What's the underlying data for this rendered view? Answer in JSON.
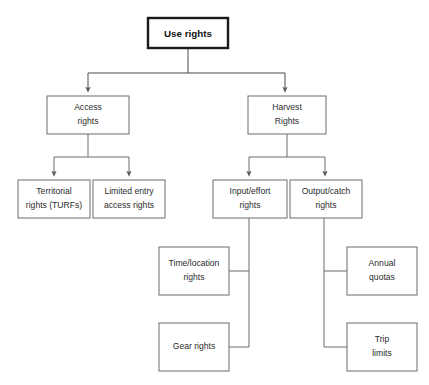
{
  "diagram": {
    "type": "hierarchy-flowchart",
    "theme": {
      "background": "#ffffff",
      "box_stroke": "#6c6c6c",
      "root_box_stroke": "#1a1a1a",
      "edge_stroke": "#6c6c6c",
      "text_color": "#2b2b2b"
    },
    "nodes": {
      "root": {
        "id": "use-rights",
        "lines": [
          "Use rights"
        ],
        "x": 148,
        "y": 18,
        "w": 80,
        "h": 30,
        "emphasis": "bold"
      },
      "level2": [
        {
          "id": "access-rights",
          "lines": [
            "Access",
            "rights"
          ],
          "x": 47,
          "y": 96,
          "w": 82,
          "h": 38
        },
        {
          "id": "harvest-rights",
          "lines": [
            "Harvest",
            "Rights"
          ],
          "x": 248,
          "y": 96,
          "w": 78,
          "h": 38
        }
      ],
      "level3": [
        {
          "id": "territorial-rights-turfs",
          "lines": [
            "Territorial",
            "rights (TURFs)"
          ],
          "x": 18,
          "y": 180,
          "w": 72,
          "h": 38
        },
        {
          "id": "limited-entry-access-rights",
          "lines": [
            "Limited entry",
            "access rights"
          ],
          "x": 93,
          "y": 180,
          "w": 72,
          "h": 38
        },
        {
          "id": "input-effort-rights",
          "lines": [
            "Input/effort",
            "rights"
          ],
          "x": 213,
          "y": 180,
          "w": 74,
          "h": 38
        },
        {
          "id": "output-catch-rights",
          "lines": [
            "Output/catch",
            "rights"
          ],
          "x": 290,
          "y": 180,
          "w": 72,
          "h": 38
        }
      ],
      "level4": [
        {
          "id": "time-location-rights",
          "lines": [
            "Time/location",
            "rights"
          ],
          "x": 159,
          "y": 247,
          "w": 70,
          "h": 48,
          "parent": "input-effort-rights",
          "side": "left"
        },
        {
          "id": "gear-rights",
          "lines": [
            "Gear rights"
          ],
          "x": 159,
          "y": 323,
          "w": 70,
          "h": 48,
          "parent": "input-effort-rights",
          "side": "left"
        },
        {
          "id": "annual-quotas",
          "lines": [
            "Annual",
            "quotas"
          ],
          "x": 347,
          "y": 247,
          "w": 70,
          "h": 48,
          "parent": "output-catch-rights",
          "side": "right"
        },
        {
          "id": "trip-limits",
          "lines": [
            "Trip",
            "limits"
          ],
          "x": 347,
          "y": 323,
          "w": 70,
          "h": 48,
          "parent": "output-catch-rights",
          "side": "right"
        }
      ]
    },
    "labels": {
      "root_0": "Use rights",
      "access_0": "Access",
      "access_1": "rights",
      "harvest_0": "Harvest",
      "harvest_1": "Rights",
      "territorial_0": "Territorial",
      "territorial_1": "rights (TURFs)",
      "limited_0": "Limited entry",
      "limited_1": "access rights",
      "input_0": "Input/effort",
      "input_1": "rights",
      "output_0": "Output/catch",
      "output_1": "rights",
      "timeloc_0": "Time/location",
      "timeloc_1": "rights",
      "gear_0": "Gear rights",
      "annual_0": "Annual",
      "annual_1": "quotas",
      "trip_0": "Trip",
      "trip_1": "limits"
    }
  }
}
